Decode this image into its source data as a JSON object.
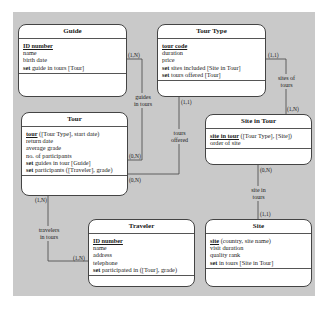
{
  "entities": {
    "guide": {
      "title": "Guide",
      "key": "ID number",
      "key_rest": "",
      "attrs": [
        "name",
        "birth date"
      ],
      "sets": [
        {
          "kw": "set",
          "text": " guide in tours [Tour]"
        }
      ]
    },
    "tour_type": {
      "title": "Tour Type",
      "key": "tour code",
      "key_rest": "",
      "attrs": [
        "duration",
        "price"
      ],
      "sets": [
        {
          "kw": "set",
          "text": " sites included [Site in Tour]"
        },
        {
          "kw": "set",
          "text": " tours offered [Tour]"
        }
      ]
    },
    "tour": {
      "title": "Tour",
      "key": "tour",
      "key_rest": " ([Tour Type], start date)",
      "attrs": [
        "return date",
        "average grade",
        "no. of participants"
      ],
      "sets": [
        {
          "kw": "set",
          "text": " guides in tour [Guide]"
        },
        {
          "kw": "set",
          "text": " participants ([Traveler], grade)"
        }
      ]
    },
    "site_in_tour": {
      "title": "Site in Tour",
      "key": "site in tour",
      "key_rest": " ([Tour Type], [Site])",
      "attrs": [
        "order of site"
      ],
      "sets": []
    },
    "traveler": {
      "title": "Traveler",
      "key": "ID number",
      "key_rest": "",
      "attrs": [
        "name",
        "address",
        "telephone"
      ],
      "sets": [
        {
          "kw": "set",
          "text": " participated in ([Tour], grade)"
        }
      ]
    },
    "site": {
      "title": "Site",
      "key": "site",
      "key_rest": " (country, site name)",
      "attrs": [
        "visit duration",
        "quality rank"
      ],
      "sets": [
        {
          "kw": "set",
          "text": " in tours [Site in Tour]"
        }
      ]
    }
  },
  "relationships": {
    "guides_in_tours": {
      "label": "guides\nin tours",
      "card_a": "(1,N)",
      "card_b": "(0,N)"
    },
    "tours_offered": {
      "label": "tours\noffered",
      "card_a": "(1,1)",
      "card_b": "(0,N)"
    },
    "sites_of_tours": {
      "label": "sites of\ntours",
      "card_a": "(1,1)",
      "card_b": "(1,N)"
    },
    "site_in_tours": {
      "label": "site in\ntours",
      "card_a": "(0,N)",
      "card_b": "(1,1)"
    },
    "travelers_in_tours": {
      "label": "travelers\nin tours",
      "card_a": "(1,N)",
      "card_b": "(1,N)"
    }
  },
  "colors": {
    "background": "#c9c9c9",
    "entity_fill": "#ffffff",
    "line": "#444444"
  }
}
